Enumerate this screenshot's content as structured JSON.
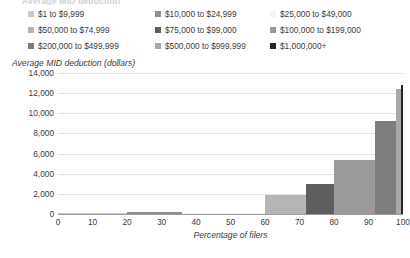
{
  "cropped_title": "Average MID deduction",
  "chart_data": {
    "type": "bar",
    "title": "",
    "xlabel": "Percentage of filers",
    "ylabel": "Average MID deduction (dollars)",
    "xlim": [
      0,
      100
    ],
    "ylim": [
      0,
      14000
    ],
    "grid": true,
    "legend_position": "top",
    "x_ticks": [
      "0",
      "10",
      "20",
      "30",
      "40",
      "50",
      "60",
      "70",
      "80",
      "90",
      "100"
    ],
    "x_tick_values": [
      0,
      10,
      20,
      30,
      40,
      50,
      60,
      70,
      80,
      90,
      100
    ],
    "y_ticks": [
      "0",
      "2,000",
      "4,000",
      "6,000",
      "8,000",
      "10,000",
      "12,000",
      "14,000"
    ],
    "y_tick_values": [
      0,
      2000,
      4000,
      6000,
      8000,
      10000,
      12000,
      14000
    ],
    "note": "Variable-width (Marimekko) bars: each income bracket occupies a span of the cumulative percentage-of-filers axis; bar height is the average MID deduction in dollars.",
    "categories": [
      "$1 to $9,999",
      "$10,000 to $24,999",
      "$25,000 to $49,000",
      "$50,000 to $74,999",
      "$75,000 to $99,000",
      "$100,000 to $199,000",
      "$200,000 to $499,999",
      "$500,000 to $999,999",
      "$1,000,000+"
    ],
    "values": [
      60,
      210,
      90,
      1900,
      3000,
      5400,
      9200,
      12400,
      12800
    ],
    "x_start": [
      0,
      20,
      36,
      60,
      72,
      80,
      92,
      98,
      99.3
    ],
    "x_end": [
      20,
      36,
      60,
      72,
      80,
      92,
      98,
      99.3,
      100
    ],
    "colors": [
      "#c9c9c9",
      "#8f8f8f",
      "#f2f2f2",
      "#b5b5b5",
      "#5e5e5e",
      "#9a9a9a",
      "#7d7d7d",
      "#a8a8a8",
      "#262626"
    ]
  },
  "legend": {
    "items": [
      {
        "label": "$1 to $9,999",
        "color": "#c9c9c9",
        "col": 0,
        "row": 0
      },
      {
        "label": "$10,000 to $24,999",
        "color": "#8f8f8f",
        "col": 1,
        "row": 0
      },
      {
        "label": "$25,000 to $49,000",
        "color": "#f2f2f2",
        "col": 2,
        "row": 0
      },
      {
        "label": "$50,000 to $74,999",
        "color": "#b5b5b5",
        "col": 0,
        "row": 1
      },
      {
        "label": "$75,000 to $99,000",
        "color": "#5e5e5e",
        "col": 1,
        "row": 1
      },
      {
        "label": "$100,000 to $199,000",
        "color": "#9a9a9a",
        "col": 2,
        "row": 1
      },
      {
        "label": "$200,000 to $499,999",
        "color": "#7d7d7d",
        "col": 0,
        "row": 2
      },
      {
        "label": "$500,000 to $999,999",
        "color": "#a8a8a8",
        "col": 1,
        "row": 2
      },
      {
        "label": "$1,000,000+",
        "color": "#262626",
        "col": 2,
        "row": 2
      }
    ]
  }
}
